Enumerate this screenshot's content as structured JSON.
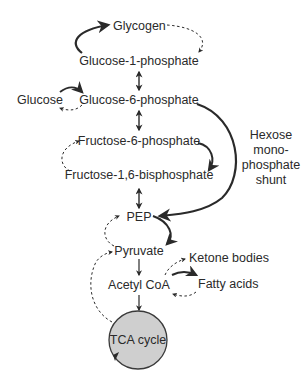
{
  "diagram": {
    "nodes": {
      "glycogen": "Glycogen",
      "glucose_1_phosphate": "Glucose-1-phosphate",
      "glucose": "Glucose",
      "glucose_6_phosphate": "Glucose-6-phosphate",
      "fructose_6_phosphate": "Fructose-6-phosphate",
      "fructose_1_6_bisphosphate": "Fructose-1,6-bisphosphate",
      "pep": "PEP",
      "pyruvate": "Pyruvate",
      "acetyl_coa": "Acetyl CoA",
      "ketone_bodies": "Ketone bodies",
      "fatty_acids": "Fatty acids",
      "tca_cycle": "TCA cycle"
    },
    "shunt_label": {
      "line1": "Hexose",
      "line2": "mono-",
      "line3": "phosphate",
      "line4": "shunt"
    },
    "edges": [
      {
        "from": "Glucose-1-phosphate",
        "to": "Glycogen",
        "style": "solid"
      },
      {
        "from": "Glycogen",
        "to": "Glucose-1-phosphate",
        "style": "dashed"
      },
      {
        "from": "Glucose-1-phosphate",
        "to": "Glucose-6-phosphate",
        "style": "bidirectional"
      },
      {
        "from": "Glucose",
        "to": "Glucose-6-phosphate",
        "style": "solid"
      },
      {
        "from": "Glucose-6-phosphate",
        "to": "Glucose",
        "style": "dashed"
      },
      {
        "from": "Glucose-6-phosphate",
        "to": "Fructose-6-phosphate",
        "style": "bidirectional"
      },
      {
        "from": "Fructose-6-phosphate",
        "to": "Fructose-1,6-bisphosphate",
        "style": "solid"
      },
      {
        "from": "Fructose-1,6-bisphosphate",
        "to": "Fructose-6-phosphate",
        "style": "dashed"
      },
      {
        "from": "Glucose-6-phosphate",
        "to": "PEP",
        "style": "solid",
        "label": "Hexose monophosphate shunt"
      },
      {
        "from": "Fructose-1,6-bisphosphate",
        "to": "PEP",
        "style": "bidirectional"
      },
      {
        "from": "PEP",
        "to": "Pyruvate",
        "style": "solid"
      },
      {
        "from": "Pyruvate",
        "to": "PEP",
        "style": "dashed"
      },
      {
        "from": "Pyruvate",
        "to": "Acetyl CoA",
        "style": "solid"
      },
      {
        "from": "Acetyl CoA",
        "to": "Ketone bodies",
        "style": "dashed"
      },
      {
        "from": "Acetyl CoA",
        "to": "Fatty acids",
        "style": "solid"
      },
      {
        "from": "Fatty acids",
        "to": "Acetyl CoA",
        "style": "dashed"
      },
      {
        "from": "Acetyl CoA",
        "to": "TCA cycle",
        "style": "solid"
      },
      {
        "from": "TCA cycle",
        "to": "Pyruvate",
        "style": "dashed"
      }
    ],
    "colors": {
      "background": "#ffffff",
      "text": "#2a2a2a",
      "arrow": "#2a2a2a",
      "tca_fill": "#cfcfcf",
      "tca_stroke": "#3a3a3a"
    }
  }
}
